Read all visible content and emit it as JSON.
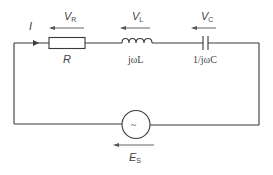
{
  "diagram": {
    "type": "series RLC circuit",
    "current": {
      "label": "I"
    },
    "components": [
      {
        "id": "resistor",
        "label": "R",
        "voltage": {
          "symbol": "V",
          "sub": "R"
        }
      },
      {
        "id": "inductor",
        "label": "jωL",
        "voltage": {
          "symbol": "V",
          "sub": "L"
        }
      },
      {
        "id": "capacitor",
        "label": "1/jωC",
        "voltage": {
          "symbol": "V",
          "sub": "C"
        }
      }
    ],
    "source": {
      "glyph": "~",
      "voltage": {
        "symbol": "E",
        "sub": "S"
      }
    }
  }
}
